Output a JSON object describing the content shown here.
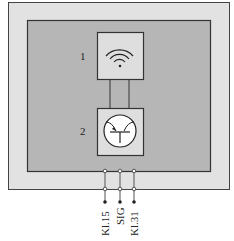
{
  "diagram": {
    "components": [
      {
        "id": "1",
        "label": "1",
        "symbol": "wireless-signal"
      },
      {
        "id": "2",
        "label": "2",
        "symbol": "transistor"
      }
    ],
    "terminals": [
      {
        "label": "Kl.15"
      },
      {
        "label": "SIG"
      },
      {
        "label": "Kl.31"
      }
    ],
    "colors": {
      "outer_housing": "#e2e2e2",
      "inner_board": "#b6b6b6",
      "component_box": "#dedede",
      "line": "#333333"
    }
  }
}
